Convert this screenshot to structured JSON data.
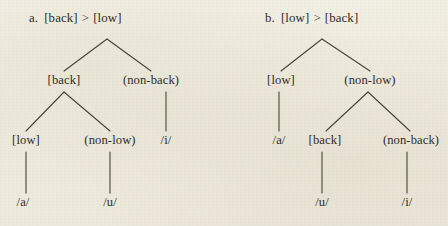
{
  "figure": {
    "background_color": "#f2efe4",
    "ink_color": "#2e2c27",
    "line_color": "#46443c"
  },
  "panels": [
    {
      "id": "panel-a",
      "caption": {
        "marker": "a.",
        "left_feature": "[back]",
        "relation": ">",
        "right_feature": "[low]",
        "full": "a.  [back] > [low]"
      },
      "tree": {
        "levels": [
          {
            "nodes": [
              {
                "label": "",
                "x": 107,
                "y": 39,
                "kind": "root-apex"
              }
            ]
          },
          {
            "nodes": [
              {
                "label": "[back]",
                "x": 64,
                "y": 83
              },
              {
                "label": "(non-back)",
                "x": 151,
                "y": 83
              }
            ]
          },
          {
            "nodes": [
              {
                "label": "[low]",
                "x": 26,
                "y": 143
              },
              {
                "label": "(non-low)",
                "x": 110,
                "y": 143
              },
              {
                "label": "/i/",
                "x": 166,
                "y": 143
              }
            ]
          },
          {
            "nodes": [
              {
                "label": "/a/",
                "x": 23,
                "y": 205
              },
              {
                "label": "/u/",
                "x": 110,
                "y": 205
              }
            ]
          }
        ],
        "edges": [
          {
            "from": [
              107,
              39
            ],
            "to": [
              64,
              71
            ]
          },
          {
            "from": [
              107,
              39
            ],
            "to": [
              151,
              71
            ]
          },
          {
            "from": [
              64,
              92
            ],
            "to": [
              26,
              131
            ]
          },
          {
            "from": [
              64,
              92
            ],
            "to": [
              110,
              131
            ]
          },
          {
            "from": [
              166,
              92
            ],
            "to": [
              166,
              131
            ]
          },
          {
            "from": [
              26,
              152
            ],
            "to": [
              26,
              193
            ]
          },
          {
            "from": [
              110,
              152
            ],
            "to": [
              110,
              193
            ]
          }
        ]
      }
    },
    {
      "id": "panel-b",
      "caption": {
        "marker": "b.",
        "left_feature": "[low]",
        "relation": ">",
        "right_feature": "[back]",
        "full": "b.  [low] > [back]"
      },
      "tree": {
        "levels": [
          {
            "nodes": [
              {
                "label": "",
                "x": 322,
                "y": 39,
                "kind": "root-apex"
              }
            ]
          },
          {
            "nodes": [
              {
                "label": "[low]",
                "x": 281,
                "y": 83
              },
              {
                "label": "(non-low)",
                "x": 370,
                "y": 83
              }
            ]
          },
          {
            "nodes": [
              {
                "label": "/a/",
                "x": 279,
                "y": 143
              },
              {
                "label": "[back]",
                "x": 323,
                "y": 143
              },
              {
                "label": "(non-back)",
                "x": 409,
                "y": 143
              }
            ]
          },
          {
            "nodes": [
              {
                "label": "/u/",
                "x": 322,
                "y": 205
              },
              {
                "label": "/i/",
                "x": 407,
                "y": 205
              }
            ]
          }
        ],
        "edges": [
          {
            "from": [
              322,
              39
            ],
            "to": [
              281,
              71
            ]
          },
          {
            "from": [
              322,
              39
            ],
            "to": [
              370,
              71
            ]
          },
          {
            "from": [
              279,
              92
            ],
            "to": [
              279,
              131
            ]
          },
          {
            "from": [
              368,
              92
            ],
            "to": [
              326,
              131
            ]
          },
          {
            "from": [
              368,
              92
            ],
            "to": [
              410,
              131
            ]
          },
          {
            "from": [
              322,
              152
            ],
            "to": [
              322,
              193
            ]
          },
          {
            "from": [
              407,
              152
            ],
            "to": [
              407,
              193
            ]
          }
        ]
      }
    }
  ]
}
